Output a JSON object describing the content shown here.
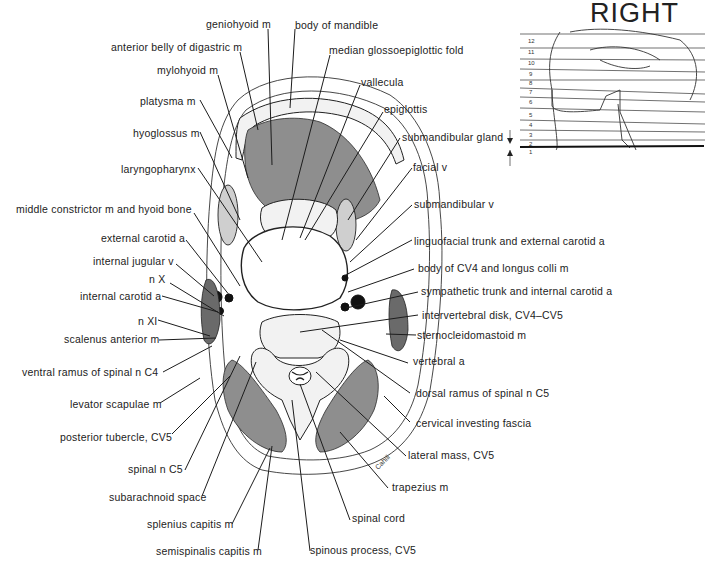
{
  "figure": {
    "orientation_label": "RIGHT",
    "signature": "Cahill",
    "labels_left": [
      {
        "id": "geniohyoid",
        "text": "geniohyoid m"
      },
      {
        "id": "anterior-belly-digastric",
        "text": "anterior belly of digastric m"
      },
      {
        "id": "mylohyoid",
        "text": "mylohyoid m"
      },
      {
        "id": "platysma",
        "text": "platysma m"
      },
      {
        "id": "hyoglossus",
        "text": "hyoglossus m"
      },
      {
        "id": "laryngopharynx",
        "text": "laryngopharynx"
      },
      {
        "id": "middle-constrictor",
        "text": "middle constrictor m and hyoid bone"
      },
      {
        "id": "external-carotid",
        "text": "external carotid a"
      },
      {
        "id": "internal-jugular",
        "text": "internal jugular v"
      },
      {
        "id": "n-x",
        "text": "n X"
      },
      {
        "id": "internal-carotid",
        "text": "internal carotid a"
      },
      {
        "id": "n-xi",
        "text": "n XI"
      },
      {
        "id": "scalenus-anterior",
        "text": "scalenus anterior m"
      },
      {
        "id": "ventral-ramus-c4",
        "text": "ventral ramus of spinal n C4"
      },
      {
        "id": "levator-scapulae",
        "text": "levator scapulae m"
      },
      {
        "id": "posterior-tubercle",
        "text": "posterior tubercle, CV5"
      },
      {
        "id": "spinal-n-c5",
        "text": "spinal n C5"
      },
      {
        "id": "subarachnoid-space",
        "text": "subarachnoid space"
      },
      {
        "id": "splenius-capitis",
        "text": "splenius capitis m"
      },
      {
        "id": "semispinalis-capitis",
        "text": "semispinalis capitis m"
      }
    ],
    "labels_right": [
      {
        "id": "body-of-mandible",
        "text": "body of mandible"
      },
      {
        "id": "median-glossoepiglottic",
        "text": "median glossoepiglottic fold"
      },
      {
        "id": "vallecula",
        "text": "vallecula"
      },
      {
        "id": "epiglottis",
        "text": "epiglottis"
      },
      {
        "id": "submandibular-gland",
        "text": "submandibular gland"
      },
      {
        "id": "facial-v",
        "text": "facial v"
      },
      {
        "id": "submandibular-v",
        "text": "submandibular v"
      },
      {
        "id": "linguofacial-trunk",
        "text": "linguofacial trunk and external carotid a"
      },
      {
        "id": "body-cv4",
        "text": "body of CV4 and longus colli m"
      },
      {
        "id": "sympathetic-trunk",
        "text": "sympathetic trunk and internal carotid a"
      },
      {
        "id": "intervertebral-disk",
        "text": "intervertebral disk, CV4–CV5"
      },
      {
        "id": "sternocleidomastoid",
        "text": "sternocleidomastoid m"
      },
      {
        "id": "vertebral-a",
        "text": "vertebral a"
      },
      {
        "id": "dorsal-ramus-c5",
        "text": "dorsal ramus of spinal n C5"
      },
      {
        "id": "cervical-investing-fascia",
        "text": "cervical investing fascia"
      },
      {
        "id": "lateral-mass",
        "text": "lateral mass, CV5"
      },
      {
        "id": "trapezius",
        "text": "trapezius m"
      },
      {
        "id": "spinal-cord",
        "text": "spinal cord"
      },
      {
        "id": "spinous-process",
        "text": "spinous process, CV5"
      }
    ],
    "reference_inset": {
      "section_numbers": [
        "12",
        "11",
        "10",
        "9",
        "8",
        "7",
        "6",
        "5",
        "4",
        "3",
        "2",
        "1"
      ],
      "highlighted_section": "1"
    }
  }
}
